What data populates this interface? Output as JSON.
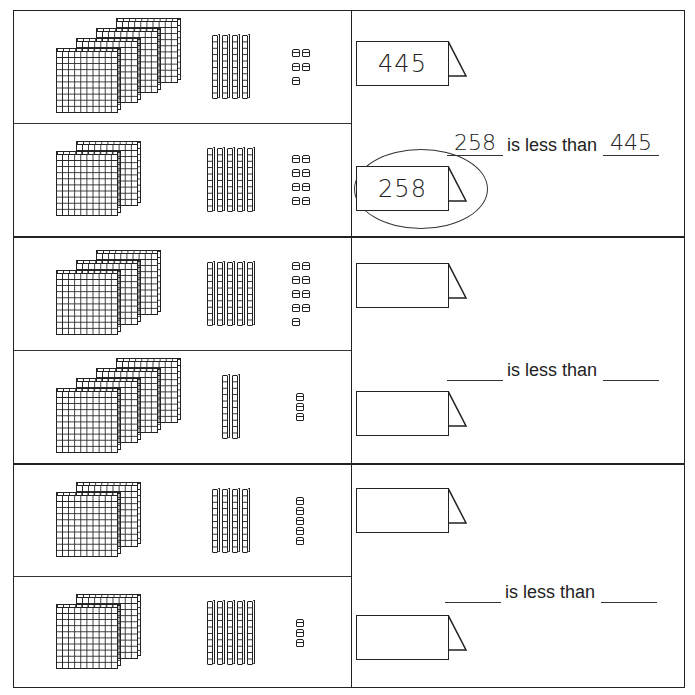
{
  "worksheet": {
    "sections": [
      {
        "blocks": [
          {
            "hundreds": 4,
            "tens": 4,
            "ones": 5,
            "label": "445",
            "circled": false
          },
          {
            "hundreds": 2,
            "tens": 5,
            "ones": 8,
            "label": "258",
            "circled": true
          }
        ],
        "sentence": {
          "left_blank": "258",
          "connector": "is less than",
          "right_blank": "445"
        }
      },
      {
        "blocks": [
          {
            "hundreds": 3,
            "tens": 5,
            "ones": 9,
            "label": "",
            "circled": false
          },
          {
            "hundreds": 4,
            "tens": 2,
            "ones": 3,
            "label": "",
            "circled": false
          }
        ],
        "sentence": {
          "left_blank": "",
          "connector": "is less than",
          "right_blank": ""
        }
      },
      {
        "blocks": [
          {
            "hundreds": 2,
            "tens": 4,
            "ones": 5,
            "label": "",
            "circled": false
          },
          {
            "hundreds": 2,
            "tens": 5,
            "ones": 3,
            "label": "",
            "circled": false
          }
        ],
        "sentence": {
          "left_blank": "",
          "connector": "is less than",
          "right_blank": ""
        }
      }
    ]
  },
  "icons": {
    "hundreds_flat": "hundreds-flat-icon",
    "tens_rod": "tens-rod-icon",
    "ones_cube": "ones-cube-icon",
    "number_tag": "tent-card-icon"
  }
}
